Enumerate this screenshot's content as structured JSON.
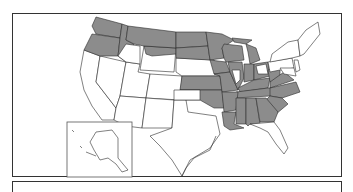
{
  "map": {
    "title": "",
    "region": "United States",
    "fill_colors": {
      "highlighted": "#8c8c8c",
      "default": "#ffffff",
      "border": "#2b2b2b",
      "frame": "#333333"
    },
    "highlighted_states": [
      "WA",
      "OR",
      "ID",
      "MT",
      "ND",
      "SD",
      "MN",
      "WI",
      "MI",
      "IA",
      "IL",
      "IN",
      "OH",
      "KY",
      "TN",
      "MO",
      "KS",
      "OK",
      "AR",
      "LA",
      "MS",
      "AL",
      "GA",
      "SC",
      "NC",
      "VA",
      "WV"
    ],
    "partially_highlighted_states": [
      "ID",
      "WY",
      "IL",
      "OK",
      "OH",
      "VA"
    ],
    "unhighlighted_states": [
      "CA",
      "NV",
      "UT",
      "AZ",
      "CO",
      "NM",
      "TX",
      "NE",
      "NY",
      "PA",
      "NJ",
      "CT",
      "RI",
      "MA",
      "VT",
      "NH",
      "ME",
      "MD",
      "DE",
      "FL",
      "AK"
    ],
    "inset": {
      "label": "Alaska",
      "shaded": false
    }
  },
  "legend": {
    "text": ""
  }
}
